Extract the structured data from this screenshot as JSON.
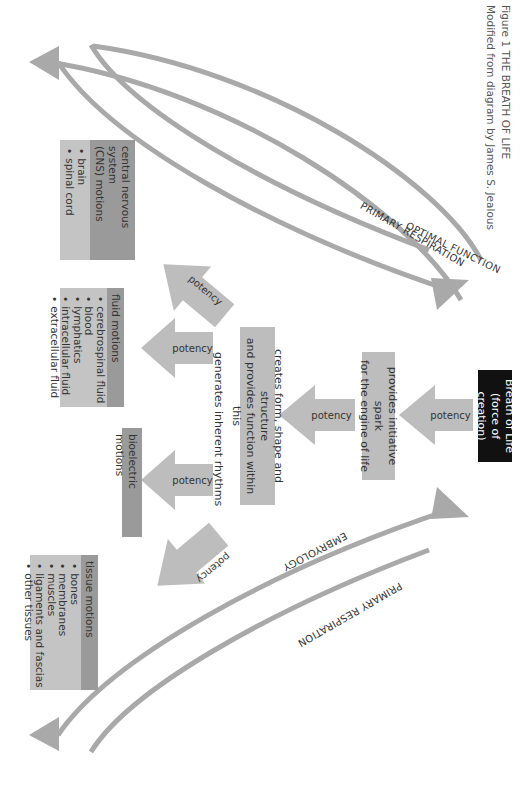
{
  "figure": {
    "title": "Figure 1 THE BREATH OF LIFE",
    "subtitle": "Modified from diagram by James S. Jealous"
  },
  "source_box": {
    "line1": "Breath of Life",
    "line2": "(force of creation)"
  },
  "spark_box": {
    "line1": "provides initiative spark",
    "line2": "for the engine of life"
  },
  "form_box": {
    "line1": "creates form, shape and structure",
    "line2": "and provides function within this"
  },
  "rhythms_label": "generates inherent rhythms",
  "potency_label": "potency",
  "cards": [
    {
      "title": "central nervous system (CNS) motions",
      "title_line1": "central nervous system",
      "title_line2": "(CNS) motions",
      "items": [
        "brain",
        "spinal cord"
      ]
    },
    {
      "title": "fluid motions",
      "items": [
        "cerebrospinal fluid",
        "blood",
        "lymphatics",
        "intracellular fluid",
        "extracellular fluid"
      ]
    },
    {
      "title": "bioelectric motions",
      "items": []
    },
    {
      "title": "tissue motions",
      "items": [
        "bones",
        "membranes",
        "muscles",
        "ligaments and fascias",
        "other tissues"
      ]
    }
  ],
  "arcs": {
    "top_outer": "OPTIMAL FUNCTION",
    "top_inner": "PRIMARY RESPIRATION",
    "bottom_outer": "EMBRYOLOGY",
    "bottom_inner": "PRIMARY RESPIRATION"
  },
  "colors": {
    "arrow": "#a9a9a9",
    "box_grey": "#bdbdbd",
    "card_header": "#9a9a9a",
    "card_body": "#c4c4c4",
    "source_box": "#111111"
  }
}
